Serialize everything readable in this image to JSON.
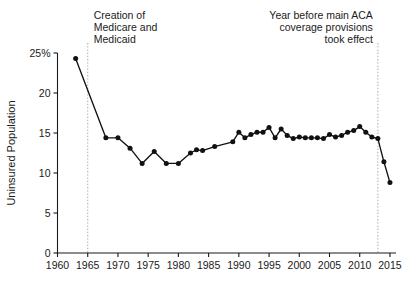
{
  "chart_data": {
    "type": "line",
    "title": "",
    "xlabel": "",
    "ylabel": "Uninsured Population",
    "xlim": [
      1960,
      2016
    ],
    "ylim": [
      0,
      25
    ],
    "grid": false,
    "legend": null,
    "x_ticks": [
      "1960",
      "1965",
      "1970",
      "1975",
      "1980",
      "1985",
      "1990",
      "1995",
      "2000",
      "2005",
      "2010",
      "2015"
    ],
    "y_ticks": [
      "0",
      "5",
      "10",
      "15",
      "20",
      "25%"
    ],
    "series": [
      {
        "name": "Uninsured Population",
        "color": "#111111",
        "x": [
          1963,
          1968,
          1970,
          1972,
          1974,
          1976,
          1978,
          1980,
          1982,
          1983,
          1984,
          1986,
          1989,
          1990,
          1991,
          1992,
          1993,
          1994,
          1995,
          1996,
          1997,
          1998,
          1999,
          2000,
          2001,
          2002,
          2003,
          2004,
          2005,
          2006,
          2007,
          2008,
          2009,
          2010,
          2011,
          2012,
          2013,
          2014,
          2015
        ],
        "values": [
          24.3,
          14.4,
          14.4,
          13.1,
          11.2,
          12.7,
          11.2,
          11.2,
          12.5,
          12.9,
          12.8,
          13.3,
          13.9,
          15.1,
          14.4,
          14.8,
          15.1,
          15.1,
          15.7,
          14.4,
          15.5,
          14.7,
          14.3,
          14.5,
          14.4,
          14.4,
          14.4,
          14.3,
          14.8,
          14.5,
          14.7,
          15.1,
          15.3,
          15.8,
          15.1,
          14.5,
          14.3,
          11.4,
          8.8
        ]
      }
    ],
    "events": [
      {
        "year": 1965,
        "label_lines": [
          "Creation of",
          "Medicare and",
          "Medicaid"
        ],
        "align": "left"
      },
      {
        "year": 2013,
        "label_lines": [
          "Year before main ACA",
          "coverage provisions",
          "took effect"
        ],
        "align": "right"
      }
    ]
  }
}
